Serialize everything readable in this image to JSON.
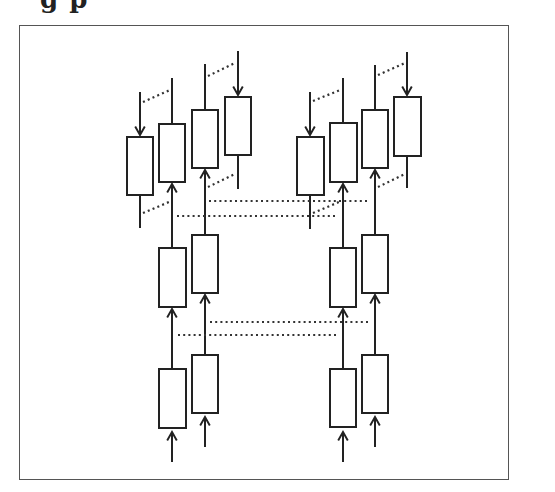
{
  "title_fragment": "g p",
  "figure": {
    "frame": {
      "x": 19,
      "y": 25,
      "w": 490,
      "h": 455
    },
    "colors": {
      "stroke": "#222222",
      "dotted": "#333333",
      "border": "#555555"
    },
    "clusters": [
      {
        "name": "left",
        "top_row": [
          {
            "x": 127,
            "y": 137,
            "w": 26,
            "h": 58,
            "stem_x": 140,
            "stem_top": 92,
            "stem_bottom": 228,
            "arrow": "down"
          },
          {
            "x": 159,
            "y": 124,
            "w": 26,
            "h": 58,
            "stem_x": 172,
            "stem_top": 78,
            "stem_bottom": 124,
            "arrow": "none"
          },
          {
            "x": 192,
            "y": 110,
            "w": 26,
            "h": 58,
            "stem_x": 205,
            "stem_top": 64,
            "stem_bottom": 110,
            "arrow": "none"
          },
          {
            "x": 225,
            "y": 97,
            "w": 26,
            "h": 58,
            "stem_x": 238,
            "stem_top": 51,
            "stem_bottom": 189,
            "arrow": "down"
          }
        ],
        "top_connectors": [
          {
            "x1": 143,
            "y1": 102,
            "x2": 170,
            "y2": 90
          },
          {
            "x1": 208,
            "y1": 76,
            "x2": 235,
            "y2": 63
          },
          {
            "x1": 143,
            "y1": 213,
            "x2": 169,
            "y2": 202
          },
          {
            "x1": 208,
            "y1": 187,
            "x2": 235,
            "y2": 174
          }
        ],
        "middle_row": [
          {
            "x": 159,
            "y": 248,
            "w": 27,
            "h": 59,
            "stem_x": 172,
            "stem_top": 186,
            "stem_bottom": 248
          },
          {
            "x": 192,
            "y": 235,
            "w": 26,
            "h": 58,
            "stem_x": 205,
            "stem_top": 172,
            "stem_bottom": 235
          }
        ],
        "bottom_row": [
          {
            "x": 159,
            "y": 369,
            "w": 27,
            "h": 59,
            "stem_x": 172,
            "stem_top": 311,
            "stem_bottom": 369
          },
          {
            "x": 192,
            "y": 355,
            "w": 26,
            "h": 58,
            "stem_x": 205,
            "stem_top": 297,
            "stem_bottom": 355
          }
        ],
        "input_arrows": [
          {
            "x": 172,
            "y_from": 462,
            "y_to": 432
          },
          {
            "x": 205,
            "y_from": 447,
            "y_to": 417
          }
        ]
      },
      {
        "name": "right",
        "top_row": [
          {
            "x": 297,
            "y": 137,
            "w": 27,
            "h": 58,
            "stem_x": 310,
            "stem_top": 92,
            "stem_bottom": 229,
            "arrow": "down"
          },
          {
            "x": 330,
            "y": 123,
            "w": 27,
            "h": 59,
            "stem_x": 343,
            "stem_top": 78,
            "stem_bottom": 123,
            "arrow": "none"
          },
          {
            "x": 362,
            "y": 110,
            "w": 26,
            "h": 58,
            "stem_x": 375,
            "stem_top": 65,
            "stem_bottom": 110,
            "arrow": "none"
          },
          {
            "x": 394,
            "y": 97,
            "w": 27,
            "h": 59,
            "stem_x": 407,
            "stem_top": 52,
            "stem_bottom": 188,
            "arrow": "down"
          }
        ],
        "top_connectors": [
          {
            "x1": 313,
            "y1": 101,
            "x2": 340,
            "y2": 90
          },
          {
            "x1": 378,
            "y1": 75,
            "x2": 405,
            "y2": 63
          },
          {
            "x1": 313,
            "y1": 213,
            "x2": 339,
            "y2": 202
          },
          {
            "x1": 378,
            "y1": 187,
            "x2": 405,
            "y2": 174
          }
        ],
        "middle_row": [
          {
            "x": 330,
            "y": 248,
            "w": 26,
            "h": 59,
            "stem_x": 343,
            "stem_top": 186,
            "stem_bottom": 248
          },
          {
            "x": 362,
            "y": 235,
            "w": 26,
            "h": 58,
            "stem_x": 375,
            "stem_top": 172,
            "stem_bottom": 235
          }
        ],
        "bottom_row": [
          {
            "x": 330,
            "y": 369,
            "w": 26,
            "h": 58,
            "stem_x": 343,
            "stem_top": 311,
            "stem_bottom": 369
          },
          {
            "x": 362,
            "y": 355,
            "w": 26,
            "h": 58,
            "stem_x": 375,
            "stem_top": 297,
            "stem_bottom": 355
          }
        ],
        "input_arrows": [
          {
            "x": 343,
            "y_from": 462,
            "y_to": 432
          },
          {
            "x": 375,
            "y_from": 447,
            "y_to": 417
          }
        ]
      }
    ],
    "cross_links": [
      {
        "y": 201,
        "x1": 209,
        "x2": 370
      },
      {
        "y": 216,
        "x1": 177,
        "x2": 337
      },
      {
        "y": 322,
        "x1": 210,
        "x2": 370
      },
      {
        "y": 335,
        "x1": 178,
        "x2": 336
      }
    ]
  }
}
